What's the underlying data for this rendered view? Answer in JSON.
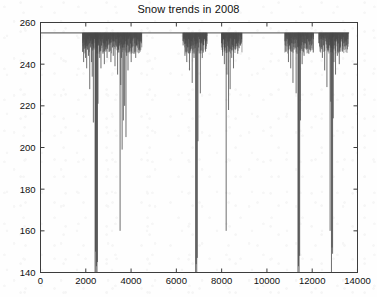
{
  "figure": {
    "title": "Snow trends in 2008",
    "background_color": "#fefefe",
    "axis_color": "#3c3c3c",
    "data_color": "#4a4a4a"
  },
  "chart_data": {
    "type": "line",
    "title": "Snow trends in 2008",
    "xlabel": "",
    "ylabel": "",
    "xlim": [
      0,
      14000
    ],
    "ylim": [
      140,
      260
    ],
    "xticks": [
      0,
      2000,
      4000,
      6000,
      8000,
      10000,
      12000,
      14000
    ],
    "yticks": [
      140,
      160,
      180,
      200,
      220,
      240,
      260
    ],
    "xtick_labels": [
      "0",
      "2000",
      "4000",
      "6000",
      "8000",
      "10000",
      "12000",
      "14000"
    ],
    "ytick_labels": [
      "140",
      "160",
      "180",
      "200",
      "220",
      "240",
      "260"
    ],
    "grid": false,
    "legend": null,
    "baseline_value": 255,
    "series": [
      {
        "name": "snow",
        "comment": "Spike list: [x, depth_min_value]. Baseline is 255; each entry is a downward excursion from the baseline.",
        "spikes": [
          [
            1870,
            246
          ],
          [
            1905,
            241
          ],
          [
            1930,
            252
          ],
          [
            1960,
            249
          ],
          [
            1990,
            243
          ],
          [
            2015,
            251
          ],
          [
            2040,
            238
          ],
          [
            2070,
            247
          ],
          [
            2095,
            252
          ],
          [
            2120,
            244
          ],
          [
            2150,
            250
          ],
          [
            2175,
            228
          ],
          [
            2200,
            248
          ],
          [
            2230,
            252
          ],
          [
            2255,
            241
          ],
          [
            2285,
            234
          ],
          [
            2310,
            250
          ],
          [
            2335,
            212
          ],
          [
            2360,
            247
          ],
          [
            2385,
            252
          ],
          [
            2410,
            140
          ],
          [
            2430,
            150
          ],
          [
            2450,
            140
          ],
          [
            2470,
            143
          ],
          [
            2495,
            140
          ],
          [
            2515,
            145
          ],
          [
            2540,
            221
          ],
          [
            2565,
            249
          ],
          [
            2590,
            252
          ],
          [
            2615,
            243
          ],
          [
            2645,
            251
          ],
          [
            2670,
            238
          ],
          [
            2700,
            249
          ],
          [
            2730,
            252
          ],
          [
            2760,
            245
          ],
          [
            2790,
            250
          ],
          [
            2820,
            240
          ],
          [
            2850,
            252
          ],
          [
            2880,
            247
          ],
          [
            2910,
            251
          ],
          [
            2940,
            243
          ],
          [
            2975,
            249
          ],
          [
            3005,
            252
          ],
          [
            3040,
            246
          ],
          [
            3075,
            250
          ],
          [
            3110,
            241
          ],
          [
            3145,
            252
          ],
          [
            3180,
            248
          ],
          [
            3215,
            244
          ],
          [
            3250,
            251
          ],
          [
            3290,
            239
          ],
          [
            3330,
            249
          ],
          [
            3370,
            252
          ],
          [
            3405,
            235
          ],
          [
            3440,
            247
          ],
          [
            3480,
            250
          ],
          [
            3515,
            160
          ],
          [
            3545,
            230
          ],
          [
            3575,
            243
          ],
          [
            3605,
            199
          ],
          [
            3630,
            252
          ],
          [
            3660,
            213
          ],
          [
            3690,
            248
          ],
          [
            3715,
            220
          ],
          [
            3745,
            251
          ],
          [
            3775,
            205
          ],
          [
            3805,
            244
          ],
          [
            3835,
            249
          ],
          [
            3865,
            237
          ],
          [
            3900,
            252
          ],
          [
            3935,
            246
          ],
          [
            3970,
            250
          ],
          [
            4005,
            241
          ],
          [
            4045,
            248
          ],
          [
            4085,
            252
          ],
          [
            4125,
            245
          ],
          [
            4165,
            250
          ],
          [
            4205,
            243
          ],
          [
            4250,
            249
          ],
          [
            4300,
            252
          ],
          [
            4350,
            247
          ],
          [
            4400,
            251
          ],
          [
            4450,
            250
          ],
          [
            6300,
            249
          ],
          [
            6340,
            252
          ],
          [
            6380,
            244
          ],
          [
            6420,
            250
          ],
          [
            6460,
            241
          ],
          [
            6500,
            248
          ],
          [
            6540,
            252
          ],
          [
            6580,
            237
          ],
          [
            6620,
            247
          ],
          [
            6660,
            251
          ],
          [
            6700,
            231
          ],
          [
            6740,
            249
          ],
          [
            6780,
            243
          ],
          [
            6815,
            252
          ],
          [
            6850,
            140
          ],
          [
            6875,
            144
          ],
          [
            6900,
            140
          ],
          [
            6925,
            147
          ],
          [
            6955,
            203
          ],
          [
            6985,
            248
          ],
          [
            7020,
            252
          ],
          [
            7060,
            226
          ],
          [
            7100,
            250
          ],
          [
            7145,
            243
          ],
          [
            7190,
            249
          ],
          [
            7240,
            252
          ],
          [
            7290,
            246
          ],
          [
            7340,
            251
          ],
          [
            8000,
            250
          ],
          [
            8040,
            244
          ],
          [
            8080,
            252
          ],
          [
            8120,
            240
          ],
          [
            8160,
            248
          ],
          [
            8200,
            160
          ],
          [
            8235,
            235
          ],
          [
            8270,
            251
          ],
          [
            8305,
            218
          ],
          [
            8340,
            246
          ],
          [
            8375,
            228
          ],
          [
            8410,
            252
          ],
          [
            8445,
            243
          ],
          [
            8485,
            249
          ],
          [
            8525,
            238
          ],
          [
            8570,
            252
          ],
          [
            8615,
            247
          ],
          [
            8660,
            250
          ],
          [
            8710,
            245
          ],
          [
            8760,
            251
          ],
          [
            8820,
            249
          ],
          [
            8880,
            252
          ],
          [
            10800,
            251
          ],
          [
            10850,
            246
          ],
          [
            10900,
            252
          ],
          [
            10950,
            241
          ],
          [
            11000,
            249
          ],
          [
            11050,
            238
          ],
          [
            11100,
            250
          ],
          [
            11150,
            231
          ],
          [
            11200,
            247
          ],
          [
            11245,
            252
          ],
          [
            11290,
            226
          ],
          [
            11330,
            245
          ],
          [
            11370,
            140
          ],
          [
            11395,
            143
          ],
          [
            11420,
            140
          ],
          [
            11445,
            148
          ],
          [
            11480,
            213
          ],
          [
            11515,
            249
          ],
          [
            11555,
            240
          ],
          [
            11595,
            252
          ],
          [
            11640,
            244
          ],
          [
            11690,
            250
          ],
          [
            11740,
            247
          ],
          [
            11795,
            252
          ],
          [
            11850,
            245
          ],
          [
            11910,
            251
          ],
          [
            11975,
            249
          ],
          [
            12045,
            252
          ],
          [
            12300,
            250
          ],
          [
            12350,
            246
          ],
          [
            12400,
            252
          ],
          [
            12450,
            243
          ],
          [
            12500,
            249
          ],
          [
            12550,
            237
          ],
          [
            12600,
            251
          ],
          [
            12650,
            229
          ],
          [
            12700,
            246
          ],
          [
            12750,
            252
          ],
          [
            12790,
            160
          ],
          [
            12820,
            222
          ],
          [
            12850,
            140
          ],
          [
            12875,
            152
          ],
          [
            12900,
            149
          ],
          [
            12930,
            214
          ],
          [
            12960,
            241
          ],
          [
            12995,
            249
          ],
          [
            13030,
            235
          ],
          [
            13070,
            252
          ],
          [
            13110,
            244
          ],
          [
            13150,
            250
          ],
          [
            13195,
            240
          ],
          [
            13240,
            248
          ],
          [
            13290,
            252
          ],
          [
            13340,
            246
          ],
          [
            13395,
            250
          ],
          [
            13450,
            251
          ],
          [
            13510,
            249
          ],
          [
            13570,
            252
          ]
        ]
      }
    ]
  }
}
